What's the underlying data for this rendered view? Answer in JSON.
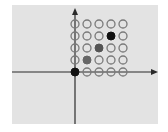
{
  "diagram": {
    "type": "lattice-grid",
    "background_color": "#e3e3e3",
    "axis_color": "#2a2a2a",
    "axes": {
      "origin_px": [
        75,
        72
      ],
      "x_axis_arrow": "right",
      "y_axis_arrow": "up"
    },
    "grid": {
      "columns": 5,
      "rows": 5,
      "spacing_px": 12,
      "open_circle_stroke": "#7a7a7a"
    },
    "points": [
      {
        "col": 0,
        "row": 0,
        "fill": "#111111",
        "label": "origin"
      },
      {
        "col": 1,
        "row": 1,
        "fill": "#666666"
      },
      {
        "col": 2,
        "row": 2,
        "fill": "#555555"
      },
      {
        "col": 3,
        "row": 3,
        "fill": "#111111"
      }
    ]
  }
}
